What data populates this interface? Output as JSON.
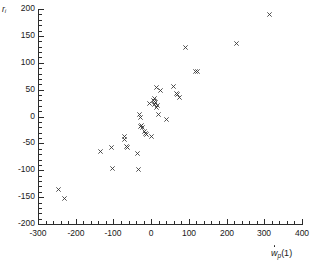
{
  "figure": {
    "background_color": "#ffffff",
    "axis_color": "#2b2b2b",
    "marker_color": "#333333"
  },
  "chart_data": {
    "type": "scatter",
    "title": "",
    "subtitle": "",
    "xlabel": "ẇp(1)",
    "ylabel": "ri",
    "xlim": [
      -300,
      400
    ],
    "ylim": [
      -200,
      200
    ],
    "xticks": [
      -300,
      -200,
      -100,
      0,
      100,
      200,
      300,
      400
    ],
    "xticklabels": [
      "-300",
      "-200",
      "-100",
      "0",
      "100",
      "200",
      "300",
      "400"
    ],
    "yticks": [
      -200,
      -150,
      -100,
      -50,
      0,
      50,
      100,
      150,
      200
    ],
    "yticklabels": [
      "-200",
      "-150",
      "-100",
      "-50",
      "0",
      "50",
      "100",
      "150",
      "200"
    ],
    "x_minor_tick_step": 20,
    "y_minor_tick_step": 10,
    "grid": false,
    "legend": null,
    "marker": "x",
    "annotations": [],
    "series": [
      {
        "name": "residuals",
        "points": [
          [
            -247,
            -136
          ],
          [
            -229,
            -152
          ],
          [
            -134,
            -65
          ],
          [
            -104,
            -57
          ],
          [
            -102,
            -96
          ],
          [
            -72,
            -42
          ],
          [
            -70,
            -38
          ],
          [
            -65,
            -56
          ],
          [
            -63,
            -58
          ],
          [
            -36,
            -68
          ],
          [
            -33,
            -99
          ],
          [
            -30,
            3
          ],
          [
            -28,
            -2
          ],
          [
            -28,
            -18
          ],
          [
            -25,
            -16
          ],
          [
            -23,
            -21
          ],
          [
            -18,
            -27
          ],
          [
            -15,
            -32
          ],
          [
            -13,
            -34
          ],
          [
            -4,
            25
          ],
          [
            0,
            -37
          ],
          [
            5,
            30
          ],
          [
            8,
            28
          ],
          [
            9,
            22
          ],
          [
            10,
            34
          ],
          [
            11,
            26
          ],
          [
            13,
            17
          ],
          [
            14,
            54
          ],
          [
            17,
            20
          ],
          [
            19,
            4
          ],
          [
            26,
            48
          ],
          [
            40,
            -5
          ],
          [
            60,
            55
          ],
          [
            68,
            43
          ],
          [
            70,
            41
          ],
          [
            76,
            36
          ],
          [
            90,
            129
          ],
          [
            117,
            83
          ],
          [
            123,
            83
          ],
          [
            226,
            135
          ],
          [
            313,
            190
          ]
        ]
      }
    ]
  }
}
